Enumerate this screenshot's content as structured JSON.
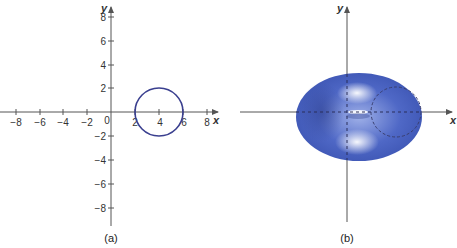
{
  "panels": [
    {
      "id": "a",
      "caption": "(a)",
      "x_axis_label": "x",
      "y_axis_label": "y",
      "x_ticks": [
        "−8",
        "−6",
        "−4",
        "−2",
        "2",
        "4",
        "6",
        "8"
      ],
      "y_ticks": [
        "8",
        "6",
        "4",
        "2",
        "−2",
        "−4",
        "−6",
        "−8"
      ],
      "origin_label": "0",
      "circle": {
        "center": [
          4,
          0
        ],
        "radius": 2,
        "color": "#3a3f8f"
      }
    },
    {
      "id": "b",
      "caption": "(b)",
      "x_axis_label": "x",
      "y_axis_label": "y",
      "surface": "torus",
      "surface_color": "#4a63c0",
      "cross_section": {
        "style": "dashed circle",
        "color": "#3a3f6f"
      }
    }
  ],
  "colors": {
    "axis": "#555555",
    "circle": "#3a3f8f",
    "torus": "#4a63c0"
  }
}
